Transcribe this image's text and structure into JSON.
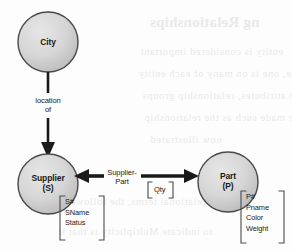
{
  "diagram": {
    "type": "entity-relationship-diagram",
    "colors": {
      "entity_fill": "#d4d4d4",
      "entity_stroke": "#4a4a4a",
      "line": "#1a1a1a",
      "text": "#1a1a1a",
      "background": "#fdfdfd",
      "ghost_text": "#e9e9e9"
    },
    "entities": [
      {
        "id": "city",
        "name": "City",
        "abbrev": "",
        "attributes": []
      },
      {
        "id": "supplier",
        "name": "Supplier",
        "abbrev": "(S)",
        "attributes": [
          "S#",
          "SName",
          "Status"
        ]
      },
      {
        "id": "part",
        "name": "Part",
        "abbrev": "(P)",
        "attributes": [
          "P#",
          "Pname",
          "Color",
          "Weight"
        ]
      }
    ],
    "relationships": [
      {
        "id": "location-of",
        "label_line1": "location",
        "label_line2": "of",
        "from": "city",
        "to": "supplier",
        "direction": "down",
        "attributes": []
      },
      {
        "id": "supplier-part",
        "label_line1": "Supplier-",
        "label_line2": "Part",
        "from": "supplier",
        "to": "part",
        "direction": "both",
        "attributes": [
          "Qty"
        ]
      }
    ],
    "bracket_open": "[",
    "bracket_close": "]"
  },
  "ghost_text": {
    "title": "ng Relationships",
    "lines": [
      "entity  is  considered  important",
      "these,  one  is  on  many  of  each  entity",
      "the  attributes,  relationship  groups",
      "can  be  made  such  as  the  relationship",
      "now  illustrated",
      "in relational terms, the  following",
      "to indicate Multiplicity  is  that  it"
    ]
  }
}
